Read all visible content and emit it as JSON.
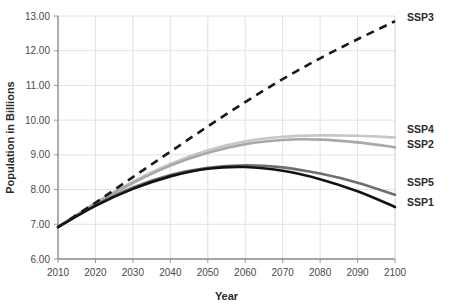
{
  "chart_data": {
    "type": "line",
    "title": "",
    "xlabel": "Year",
    "ylabel": "Population in Billions",
    "xlim": [
      2010,
      2100
    ],
    "ylim": [
      6.0,
      13.0
    ],
    "grid": true,
    "legend_position": "right-of-plot-line-ends",
    "x": [
      2010,
      2020,
      2030,
      2040,
      2050,
      2060,
      2070,
      2080,
      2090,
      2100
    ],
    "xticklabels": [
      "2010",
      "2020",
      "2030",
      "2040",
      "2050",
      "2060",
      "2070",
      "2080",
      "2090",
      "2100"
    ],
    "yticklabels": [
      "6.00",
      "7.00",
      "8.00",
      "9.00",
      "10.00",
      "11.00",
      "12.00",
      "13.00"
    ],
    "yticks": [
      6.0,
      7.0,
      8.0,
      9.0,
      10.0,
      11.0,
      12.0,
      13.0
    ],
    "series": [
      {
        "name": "SSP3",
        "label": "SSP3",
        "color": "#1a1a1a",
        "style": "dashed",
        "width": 2.6,
        "values": [
          6.92,
          7.62,
          8.36,
          9.09,
          9.82,
          10.52,
          11.18,
          11.78,
          12.33,
          12.85
        ]
      },
      {
        "name": "SSP4",
        "label": "SSP4",
        "color": "#c7c7c7",
        "style": "solid",
        "width": 2.6,
        "values": [
          6.92,
          7.62,
          8.23,
          8.74,
          9.13,
          9.39,
          9.52,
          9.56,
          9.55,
          9.5
        ]
      },
      {
        "name": "SSP2",
        "label": "SSP2",
        "color": "#a8a8a8",
        "style": "solid",
        "width": 2.6,
        "values": [
          6.92,
          7.6,
          8.19,
          8.69,
          9.06,
          9.31,
          9.43,
          9.44,
          9.36,
          9.22
        ]
      },
      {
        "name": "SSP5",
        "label": "SSP5",
        "color": "#6e6e6e",
        "style": "solid",
        "width": 2.6,
        "values": [
          6.92,
          7.55,
          8.06,
          8.42,
          8.63,
          8.7,
          8.64,
          8.46,
          8.2,
          7.85
        ]
      },
      {
        "name": "SSP1",
        "label": "SSP1",
        "color": "#121212",
        "style": "solid",
        "width": 2.6,
        "values": [
          6.92,
          7.53,
          8.02,
          8.38,
          8.6,
          8.65,
          8.54,
          8.3,
          7.95,
          7.5
        ]
      }
    ]
  }
}
